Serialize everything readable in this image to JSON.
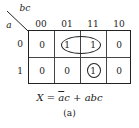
{
  "kmap": {
    "row_var": "a",
    "col_var": "bc",
    "col_headers": [
      "00",
      "01",
      "11",
      "10"
    ],
    "row_headers": [
      "0",
      "1"
    ],
    "cells": [
      [
        "0",
        "1",
        "1",
        "0"
      ],
      [
        "0",
        "0",
        "1",
        "0"
      ]
    ],
    "groups": [
      {
        "cells": [
          [
            0,
            1
          ],
          [
            0,
            2
          ]
        ],
        "shape": "ellipse"
      },
      {
        "cells": [
          [
            1,
            2
          ]
        ],
        "shape": "circle"
      }
    ]
  },
  "equation": {
    "lhs": "X",
    "equals": "=",
    "term1_overbar": "a",
    "term1_rest": "c",
    "plus": "+",
    "term2": "abc"
  },
  "caption": "(a)"
}
